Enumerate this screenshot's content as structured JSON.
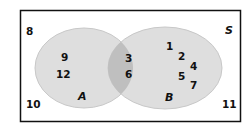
{
  "diagram": {
    "type": "venn",
    "universal_label": "S",
    "sets": [
      {
        "label": "A",
        "only": [
          "9",
          "12"
        ]
      },
      {
        "label": "B",
        "only": [
          "1",
          "2",
          "4",
          "5",
          "7"
        ]
      }
    ],
    "intersection": [
      "3",
      "6"
    ],
    "outside": [
      "8",
      "10",
      "11"
    ],
    "colors": {
      "set_fill": "#dcdcdc",
      "intersection_fill": "#bdbdbd",
      "border": "#111111"
    }
  },
  "labels": {
    "S": "S",
    "A": "A",
    "B": "B",
    "n8": "8",
    "n10": "10",
    "n11": "11",
    "n9": "9",
    "n12": "12",
    "n3": "3",
    "n6": "6",
    "n1": "1",
    "n2": "2",
    "n4": "4",
    "n5": "5",
    "n7": "7"
  }
}
